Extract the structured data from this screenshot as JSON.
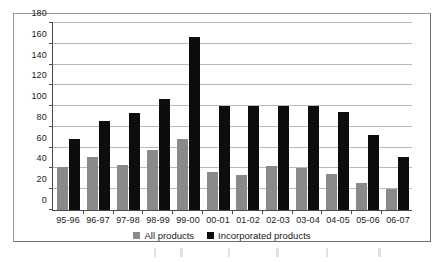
{
  "chart_data": {
    "type": "bar",
    "title": "",
    "subtitle": "",
    "xlabel": "",
    "ylabel": "",
    "ylim": [
      0,
      180
    ],
    "yticks": [
      0,
      20,
      40,
      60,
      80,
      100,
      120,
      140,
      160,
      180
    ],
    "ytick_labels": [
      "0",
      "20",
      "40",
      "60",
      "80",
      "100",
      "120",
      "140",
      "160",
      "180"
    ],
    "grid": "horizontal",
    "legend_position": "bottom-center",
    "categories": [
      "95-96",
      "96-97",
      "97-98",
      "98-99",
      "99-00",
      "00-01",
      "01-02",
      "02-03",
      "03-04",
      "04-05",
      "05-06",
      "06-07"
    ],
    "series": [
      {
        "name": "All products",
        "color": "#8a8a8a",
        "values": [
          41,
          51,
          43,
          58,
          68,
          37,
          34,
          42,
          40,
          35,
          26,
          20
        ]
      },
      {
        "name": "Incorporated products",
        "color": "#0d0d0d",
        "values": [
          68,
          86,
          93,
          107,
          167,
          100,
          100,
          100,
          100,
          94,
          72,
          51
        ]
      }
    ]
  },
  "legend": {
    "items": [
      {
        "label": "All products",
        "color": "#8a8a8a"
      },
      {
        "label": "Incorporated products",
        "color": "#0d0d0d"
      }
    ]
  }
}
